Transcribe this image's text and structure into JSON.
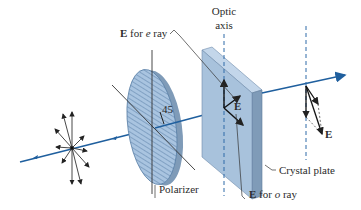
{
  "diagram": {
    "labels": {
      "e_ray": {
        "prefix": "E",
        "text": " for ",
        "ray_symbol": "e",
        "suffix": " ray"
      },
      "o_ray": {
        "prefix": "E",
        "text": " for ",
        "ray_symbol": "o",
        "suffix": " ray"
      },
      "optic_axis_line1": "Optic",
      "optic_axis_line2": "axis",
      "polarizer": "Polarizer",
      "crystal_plate": "Crystal plate",
      "angle": "45",
      "e_vector_plate": "E",
      "e_vector_exit": "E"
    },
    "colors": {
      "ray": "#1f5f9e",
      "polarizer_fill": "#a9c4e0",
      "polarizer_hatch": "#5a7fa6",
      "plate_front": "#a8c2dc",
      "plate_side": "#7f9bb8",
      "plate_top": "#c3d6ea",
      "vector": "#222222",
      "axis_dash": "#2f6aa8"
    }
  }
}
